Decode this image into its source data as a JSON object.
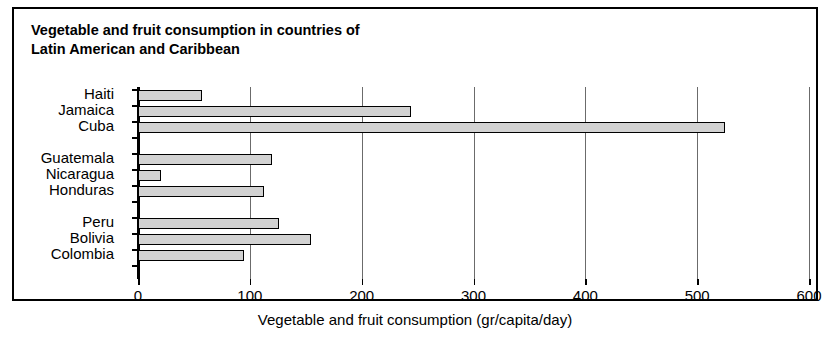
{
  "figure": {
    "title": "Vegetable and fruit consumption in countries of\nLatin American and Caribbean",
    "xaxis_title": "Vegetable and fruit consumption (gr/capita/day)",
    "frame_color": "#000000",
    "bar_fill_color": "#d2d2d2",
    "bar_edge_color": "#000000",
    "gridline_color": "#6b6b6b",
    "background_color": "#ffffff"
  },
  "chart_data": {
    "type": "bar",
    "orientation": "horizontal",
    "title": "Vegetable and fruit consumption in countries of Latin American and Caribbean",
    "xlabel": "Vegetable and fruit consumption (gr/capita/day)",
    "ylabel": "",
    "xlim": [
      0,
      600
    ],
    "xticks": [
      0,
      100,
      200,
      300,
      400,
      500,
      600
    ],
    "xticklabels": [
      "0",
      "100",
      "200",
      "300",
      "400",
      "500",
      "600"
    ],
    "grid": true,
    "legend": null,
    "categories": [
      "Haiti",
      "Jamaica",
      "Cuba",
      "Guatemala",
      "Nicaragua",
      "Honduras",
      "Peru",
      "Bolivia",
      "Colombia"
    ],
    "values": [
      57,
      244,
      525,
      120,
      21,
      113,
      126,
      155,
      95
    ],
    "groups": [
      {
        "name": "group-1",
        "categories": [
          "Haiti",
          "Jamaica",
          "Cuba"
        ],
        "values": [
          57,
          244,
          525
        ]
      },
      {
        "name": "group-2",
        "categories": [
          "Guatemala",
          "Nicaragua",
          "Honduras"
        ],
        "values": [
          120,
          21,
          113
        ]
      },
      {
        "name": "group-3",
        "categories": [
          "Peru",
          "Bolivia",
          "Colombia"
        ],
        "values": [
          126,
          155,
          95
        ]
      }
    ],
    "bars": [
      {
        "label": "Haiti",
        "value": 57,
        "row": 0
      },
      {
        "label": "Jamaica",
        "value": 244,
        "row": 1
      },
      {
        "label": "Cuba",
        "value": 525,
        "row": 2
      },
      {
        "label": "Guatemala",
        "value": 120,
        "row": 4
      },
      {
        "label": "Nicaragua",
        "value": 21,
        "row": 5
      },
      {
        "label": "Honduras",
        "value": 113,
        "row": 6
      },
      {
        "label": "Peru",
        "value": 126,
        "row": 8
      },
      {
        "label": "Bolivia",
        "value": 155,
        "row": 9
      },
      {
        "label": "Colombia",
        "value": 95,
        "row": 10
      }
    ]
  }
}
